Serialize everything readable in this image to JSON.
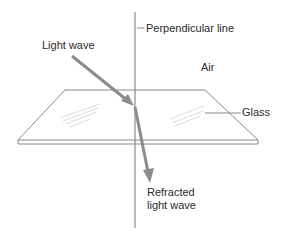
{
  "diagram": {
    "labels": {
      "perpendicular": "Perpendicular line",
      "light_wave": "Light wave",
      "air": "Air",
      "glass": "Glass",
      "refracted_line1": "Refracted",
      "refracted_line2": "light wave"
    },
    "colors": {
      "background": "#ffffff",
      "line": "#8a8a8a",
      "ray": "#8c8c8c",
      "text": "#2a2a2a",
      "glass_hatch": "#cfcfcf"
    }
  }
}
